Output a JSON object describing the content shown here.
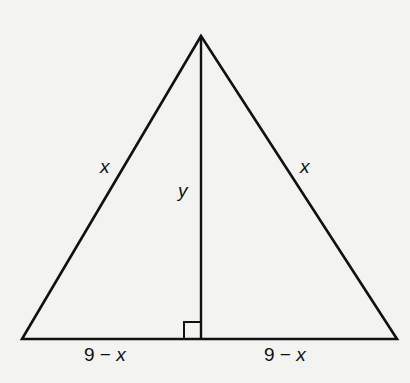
{
  "diagram": {
    "type": "isosceles-triangle-with-altitude",
    "vertices": {
      "apex": [
        201,
        36
      ],
      "base_left": [
        22,
        339
      ],
      "base_right": [
        397,
        339
      ],
      "altitude_foot": [
        201,
        339
      ]
    },
    "right_angle_marker": {
      "x": 184,
      "y": 322,
      "size": 17
    },
    "stroke_color": "#111111",
    "background_color": "#f3f3f1",
    "labels": {
      "left_side": "x",
      "right_side": "x",
      "altitude": "y",
      "base_left_part": {
        "number": "9",
        "op": "−",
        "var": "x"
      },
      "base_right_part": {
        "number": "9",
        "op": "−",
        "var": "x"
      }
    }
  }
}
